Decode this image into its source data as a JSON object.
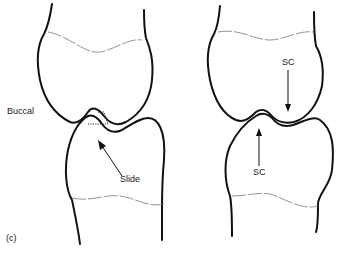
{
  "figure": {
    "panel_label": "(c)",
    "left_diagram": {
      "side_label": "Buccal",
      "arrow_label": "Slide"
    },
    "right_diagram": {
      "upper_arrow_label": "SC",
      "lower_arrow_label": "SC"
    }
  }
}
